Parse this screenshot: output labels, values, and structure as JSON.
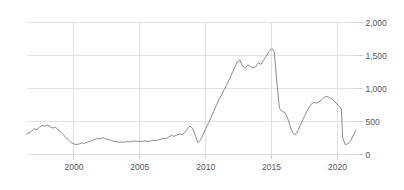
{
  "chart_data": {
    "type": "line",
    "title": "",
    "subtitle": "",
    "xlabel": "",
    "ylabel": "",
    "xlim": [
      1996.4,
      2021.6
    ],
    "ylim": [
      0,
      2000
    ],
    "grid": true,
    "legend": false,
    "legend_position": "none",
    "y_ticks": [
      0,
      500,
      1000,
      1500,
      2000
    ],
    "y_tick_labels": [
      "0",
      "500",
      "1,000",
      "1,500",
      "2,000"
    ],
    "x_ticks": [
      2000,
      2005,
      2010,
      2015,
      2020
    ],
    "x_tick_labels": [
      "2000",
      "2005",
      "2010",
      "2015",
      "2020"
    ],
    "series": [
      {
        "name": "series-1",
        "color": "#7d7d7d",
        "x": [
          1996.4,
          1996.6,
          1996.8,
          1997.0,
          1997.2,
          1997.4,
          1997.6,
          1997.8,
          1998.0,
          1998.2,
          1998.4,
          1998.6,
          1998.8,
          1999.0,
          1999.2,
          1999.4,
          1999.6,
          1999.8,
          2000.0,
          2000.2,
          2000.4,
          2000.6,
          2000.8,
          2001.0,
          2001.2,
          2001.4,
          2001.6,
          2001.8,
          2002.0,
          2002.2,
          2002.4,
          2002.6,
          2002.8,
          2003.0,
          2003.2,
          2003.4,
          2003.6,
          2003.8,
          2004.0,
          2004.2,
          2004.4,
          2004.6,
          2004.8,
          2005.0,
          2005.2,
          2005.4,
          2005.6,
          2005.8,
          2006.0,
          2006.2,
          2006.4,
          2006.6,
          2006.8,
          2007.0,
          2007.2,
          2007.4,
          2007.6,
          2007.8,
          2008.0,
          2008.2,
          2008.4,
          2008.6,
          2008.8,
          2009.0,
          2009.2,
          2009.4,
          2009.6,
          2009.8,
          2010.0,
          2010.2,
          2010.4,
          2010.6,
          2010.8,
          2011.0,
          2011.2,
          2011.4,
          2011.6,
          2011.8,
          2012.0,
          2012.2,
          2012.4,
          2012.6,
          2012.8,
          2013.0,
          2013.2,
          2013.4,
          2013.6,
          2013.8,
          2014.0,
          2014.2,
          2014.4,
          2014.6,
          2014.8,
          2015.0,
          2015.1,
          2015.2,
          2015.4,
          2015.6,
          2015.8,
          2016.0,
          2016.2,
          2016.4,
          2016.6,
          2016.8,
          2017.0,
          2017.2,
          2017.4,
          2017.6,
          2017.8,
          2018.0,
          2018.2,
          2018.4,
          2018.6,
          2018.8,
          2019.0,
          2019.2,
          2019.4,
          2019.6,
          2019.8,
          2020.0,
          2020.1,
          2020.2,
          2020.3,
          2020.4,
          2020.6,
          2020.8,
          2021.0,
          2021.2,
          2021.4
        ],
        "values": [
          310,
          330,
          355,
          390,
          380,
          415,
          440,
          430,
          445,
          420,
          400,
          415,
          375,
          340,
          300,
          255,
          215,
          180,
          160,
          150,
          160,
          175,
          170,
          185,
          200,
          215,
          230,
          245,
          240,
          255,
          235,
          230,
          215,
          200,
          195,
          185,
          190,
          185,
          195,
          190,
          200,
          205,
          200,
          195,
          200,
          205,
          200,
          205,
          215,
          210,
          220,
          230,
          245,
          240,
          265,
          290,
          275,
          295,
          310,
          300,
          330,
          380,
          430,
          400,
          300,
          180,
          215,
          300,
          390,
          470,
          560,
          650,
          740,
          830,
          900,
          980,
          1060,
          1140,
          1230,
          1320,
          1400,
          1430,
          1340,
          1305,
          1360,
          1330,
          1310,
          1330,
          1390,
          1365,
          1430,
          1490,
          1560,
          1600,
          1590,
          1560,
          1100,
          700,
          650,
          640,
          560,
          440,
          330,
          300,
          360,
          450,
          540,
          620,
          700,
          760,
          790,
          780,
          800,
          830,
          870,
          880,
          860,
          840,
          800,
          760,
          730,
          720,
          690,
          250,
          150,
          165,
          210,
          290,
          370
        ]
      }
    ]
  }
}
